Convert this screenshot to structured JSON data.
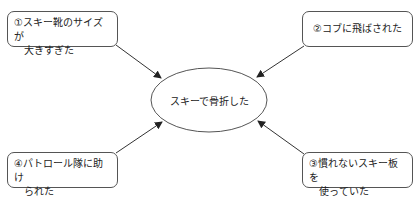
{
  "diagram": {
    "center": {
      "label": "スキーで骨折した"
    },
    "causes": [
      {
        "id": "1",
        "line1": "①スキー靴のサイズが",
        "line2": "大きすぎた"
      },
      {
        "id": "2",
        "line1": "②コブに飛ばされた",
        "line2": ""
      },
      {
        "id": "3",
        "line1": "③慣れないスキー板を",
        "line2": "使っていた"
      },
      {
        "id": "4",
        "line1": "④パトロール隊に助け",
        "line2": "られた"
      }
    ],
    "colors": {
      "stroke": "#555555",
      "arrow": "#222222",
      "background": "#ffffff"
    }
  }
}
